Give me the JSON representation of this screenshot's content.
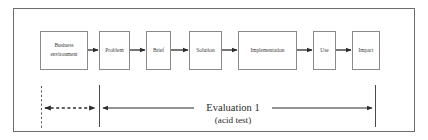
{
  "diagram": {
    "frame": {
      "x": 13,
      "y": 8,
      "width": 402,
      "height": 124,
      "stroke": "#6d6d6d",
      "fill": "#ffffff"
    },
    "style": {
      "box_stroke": "#8a8a8a",
      "box_fill": "#ffffff",
      "text_color": "#3a3a3a",
      "arrow_color": "#2b2b2b",
      "dashed_color": "#555555",
      "background": "#ffffff"
    },
    "nodes": [
      {
        "id": "business-environment",
        "label_line1": "Business",
        "label_line2": "environment",
        "x": 40,
        "y": 31,
        "width": 48,
        "height": 39
      },
      {
        "id": "problem",
        "label_line1": "Problem",
        "label_line2": "",
        "x": 99,
        "y": 31,
        "width": 31,
        "height": 39
      },
      {
        "id": "brief",
        "label_line1": "Brief",
        "label_line2": "",
        "x": 146,
        "y": 31,
        "width": 25,
        "height": 39
      },
      {
        "id": "solution",
        "label_line1": "Solution",
        "label_line2": "",
        "x": 189,
        "y": 31,
        "width": 33,
        "height": 39
      },
      {
        "id": "implementation",
        "label_line1": "Implementation",
        "label_line2": "",
        "x": 238,
        "y": 31,
        "width": 59,
        "height": 39
      },
      {
        "id": "use",
        "label_line1": "Use",
        "label_line2": "",
        "x": 313,
        "y": 31,
        "width": 23,
        "height": 39
      },
      {
        "id": "impact",
        "label_line1": "Impact",
        "label_line2": "",
        "x": 352,
        "y": 31,
        "width": 28,
        "height": 39
      }
    ],
    "connectors": [
      {
        "id": "business-environment-to-problem",
        "from": "business-environment",
        "to": "problem",
        "x1": 88,
        "x2": 99,
        "y": 50
      },
      {
        "id": "problem-to-brief",
        "from": "problem",
        "to": "brief",
        "x1": 130,
        "x2": 146,
        "y": 50
      },
      {
        "id": "brief-to-solution",
        "from": "brief",
        "to": "solution",
        "x1": 171,
        "x2": 189,
        "y": 50
      },
      {
        "id": "solution-to-implementation",
        "from": "solution",
        "to": "implementation",
        "x1": 222,
        "x2": 238,
        "y": 50
      },
      {
        "id": "implementation-to-use",
        "from": "implementation",
        "to": "use",
        "x1": 297,
        "x2": 313,
        "y": 50
      },
      {
        "id": "use-to-impact",
        "from": "use",
        "to": "impact",
        "x1": 336,
        "x2": 352,
        "y": 50
      }
    ],
    "measure_lines": [
      {
        "id": "left-dashed-boundary",
        "kind": "dashed-vertical",
        "x": 41,
        "y1": 86,
        "y2": 128
      },
      {
        "id": "middle-solid-boundary",
        "kind": "solid-vertical",
        "x": 99,
        "y1": 85,
        "y2": 127
      },
      {
        "id": "right-solid-boundary",
        "kind": "solid-vertical",
        "x": 375,
        "y1": 85,
        "y2": 127
      }
    ],
    "measure_arrows": [
      {
        "id": "pre-brief-span-arrow",
        "kind": "dashed-double",
        "x1": 41,
        "x2": 99,
        "y": 108
      },
      {
        "id": "evaluation-span-arrow",
        "kind": "solid-double",
        "x1": 99,
        "x2": 375,
        "y": 108
      }
    ],
    "annotation": {
      "id": "evaluation-annotation",
      "line1": "Evaluation 1",
      "line2": "(acid test)",
      "center_x": 233,
      "line1_y": 107,
      "line2_y": 119,
      "gap_left": 194,
      "gap_right": 272
    }
  }
}
